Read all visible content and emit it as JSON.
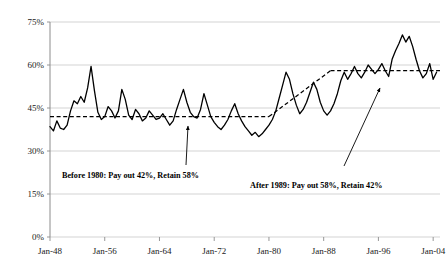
{
  "chart_data": {
    "type": "line",
    "title": "",
    "xlabel": "",
    "ylabel": "",
    "ylim": [
      0,
      75
    ],
    "xlim": [
      1948,
      2005
    ],
    "grid": true,
    "legend": null,
    "ytick_labels": [
      "75%",
      "60%",
      "45%",
      "30%",
      "15%",
      "0%"
    ],
    "ytick_values": [
      75,
      60,
      45,
      30,
      15,
      0
    ],
    "xtick_labels": [
      "Jan-48",
      "Jan-56",
      "Jan-64",
      "Jan-72",
      "Jan-80",
      "Jan-88",
      "Jan-96",
      "Jan-04"
    ],
    "xtick_values": [
      1948,
      1956,
      1964,
      1972,
      1980,
      1988,
      1996,
      2004
    ],
    "series": [
      {
        "name": "payout-ratio",
        "x": [
          1948.0,
          1948.5,
          1949.0,
          1949.5,
          1950.0,
          1950.5,
          1951.0,
          1951.5,
          1952.0,
          1952.5,
          1953.0,
          1953.5,
          1954.0,
          1954.5,
          1955.0,
          1955.5,
          1956.0,
          1956.5,
          1957.0,
          1957.5,
          1958.0,
          1958.5,
          1959.0,
          1959.5,
          1960.0,
          1960.5,
          1961.0,
          1961.5,
          1962.0,
          1962.5,
          1963.0,
          1963.5,
          1964.0,
          1964.5,
          1965.0,
          1965.5,
          1966.0,
          1966.5,
          1967.0,
          1967.5,
          1968.0,
          1968.5,
          1969.0,
          1969.5,
          1970.0,
          1970.5,
          1971.0,
          1971.5,
          1972.0,
          1972.5,
          1973.0,
          1973.5,
          1974.0,
          1974.5,
          1975.0,
          1975.5,
          1976.0,
          1976.5,
          1977.0,
          1977.5,
          1978.0,
          1978.5,
          1979.0,
          1979.5,
          1980.0,
          1980.5,
          1981.0,
          1981.5,
          1982.0,
          1982.5,
          1983.0,
          1983.5,
          1984.0,
          1984.5,
          1985.0,
          1985.5,
          1986.0,
          1986.5,
          1987.0,
          1987.5,
          1988.0,
          1988.5,
          1989.0,
          1989.5,
          1990.0,
          1990.5,
          1991.0,
          1991.5,
          1992.0,
          1992.5,
          1993.0,
          1993.5,
          1994.0,
          1994.5,
          1995.0,
          1995.5,
          1996.0,
          1996.5,
          1997.0,
          1997.5,
          1998.0,
          1998.5,
          1999.0,
          1999.5,
          2000.0,
          2000.5,
          2001.0,
          2001.5,
          2002.0,
          2002.5,
          2003.0,
          2003.5,
          2004.0,
          2004.5
        ],
        "y": [
          38.5,
          37.0,
          40.5,
          38.0,
          37.5,
          39.0,
          44.0,
          47.5,
          46.5,
          49.0,
          47.0,
          52.0,
          59.5,
          51.0,
          43.5,
          41.0,
          42.0,
          45.5,
          44.0,
          41.5,
          44.0,
          51.5,
          48.0,
          42.5,
          41.0,
          44.5,
          43.0,
          40.5,
          41.5,
          44.0,
          42.5,
          41.0,
          41.5,
          43.0,
          41.0,
          39.0,
          40.5,
          44.5,
          48.0,
          51.5,
          47.0,
          43.5,
          42.0,
          41.5,
          44.5,
          50.0,
          46.0,
          42.0,
          40.0,
          38.5,
          37.5,
          39.0,
          41.0,
          44.0,
          46.5,
          43.0,
          40.5,
          38.5,
          37.0,
          35.5,
          36.5,
          35.0,
          36.0,
          37.5,
          39.0,
          41.0,
          44.0,
          48.5,
          53.0,
          57.5,
          55.0,
          50.0,
          46.0,
          43.0,
          44.5,
          47.0,
          50.5,
          54.0,
          51.5,
          47.0,
          44.0,
          42.5,
          44.0,
          46.5,
          50.0,
          54.5,
          57.5,
          55.0,
          57.0,
          59.5,
          57.0,
          55.5,
          57.5,
          60.0,
          58.5,
          57.0,
          58.5,
          60.5,
          58.0,
          56.0,
          62.0,
          65.0,
          67.5,
          70.5,
          68.0,
          70.0,
          66.5,
          62.0,
          58.0,
          55.5,
          57.0,
          60.5,
          55.0,
          57.5
        ],
        "color": "#000000",
        "style": "solid"
      },
      {
        "name": "trend-before-1980",
        "x": [
          1948.0,
          1980.0
        ],
        "y": [
          42.0,
          42.0
        ],
        "color": "#000000",
        "style": "dashed"
      },
      {
        "name": "trend-transition",
        "x": [
          1980.0,
          1989.0
        ],
        "y": [
          42.0,
          58.0
        ],
        "color": "#000000",
        "style": "dashed"
      },
      {
        "name": "trend-after-1989",
        "x": [
          1989.0,
          2005.0
        ],
        "y": [
          58.0,
          58.0
        ],
        "color": "#000000",
        "style": "dashed"
      }
    ],
    "annotations": [
      {
        "name": "annotation-before-1980",
        "text": "Before 1980: Pay out 42%, Retain 58%",
        "text_x": 62,
        "text_y": 178,
        "arrow_from_x": 186,
        "arrow_from_y": 165,
        "arrow_to_x": 188,
        "arrow_to_y": 126
      },
      {
        "name": "annotation-after-1989",
        "text": "After 1989:   Pay out 58%, Retain 42%",
        "text_x": 250,
        "text_y": 188,
        "arrow_from_x": 344,
        "arrow_from_y": 166,
        "arrow_to_x": 380,
        "arrow_to_y": 88
      }
    ],
    "colors": {
      "line": "#000000",
      "trend": "#000000",
      "grid": "#c8c8c8",
      "axis": "#8c8c8c",
      "text": "#1a1a1a"
    }
  }
}
